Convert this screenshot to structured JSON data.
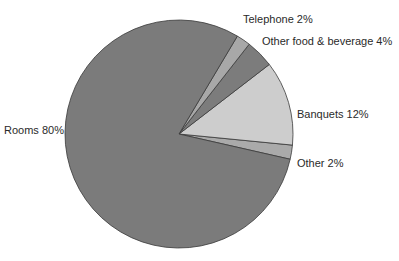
{
  "chart_data": {
    "type": "pie",
    "title": "",
    "center": [
      179,
      134
    ],
    "radius": 114,
    "start_angle_deg": 12.8,
    "direction": "counterclockwise",
    "slices": [
      {
        "label": "Other",
        "value": 2,
        "display": "Other 2%",
        "color": "#aaaaaa"
      },
      {
        "label": "Banquets",
        "value": 12,
        "display": "Banquets 12%",
        "color": "#cdcdcd"
      },
      {
        "label": "Other food & beverage",
        "value": 4,
        "display": "Other food & beverage 4%",
        "color": "#7c7c7c"
      },
      {
        "label": "Telephone",
        "value": 2,
        "display": "Telephone 2%",
        "color": "#a8a8a8"
      },
      {
        "label": "Rooms",
        "value": 80,
        "display": "Rooms 80%",
        "color": "#7b7b7b"
      }
    ],
    "legend": "none (labels placed beside slices)"
  },
  "labels": {
    "telephone": "Telephone 2%",
    "other_food": "Other food & beverage 4%",
    "banquets": "Banquets 12%",
    "other": "Other 2%",
    "rooms": "Rooms 80%"
  }
}
